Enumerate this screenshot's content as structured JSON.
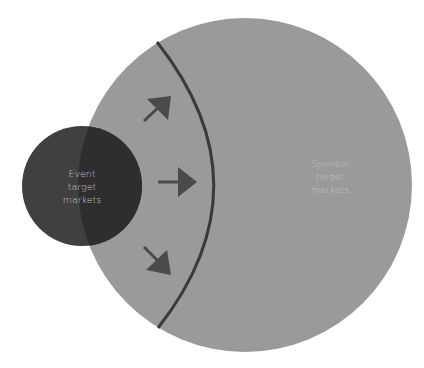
{
  "diagram": {
    "type": "venn-overlap",
    "colors": {
      "sponsor_circle": "#9a9a9a",
      "event_circle": "#3f3f3f",
      "overlap": "#2f2f2f",
      "arc": "#3a3a3a",
      "arrows": "#4a4a4a",
      "event_text": "#c9c9c9",
      "sponsor_text": "#c4c4c4"
    },
    "event_circle": {
      "label_lines": [
        "Event",
        "target",
        "markets"
      ]
    },
    "sponsor_circle": {
      "label_lines": [
        "Sponsor",
        "target",
        "markets"
      ]
    },
    "arrows": [
      {
        "direction": "up-right"
      },
      {
        "direction": "right"
      },
      {
        "direction": "down-right"
      }
    ]
  }
}
